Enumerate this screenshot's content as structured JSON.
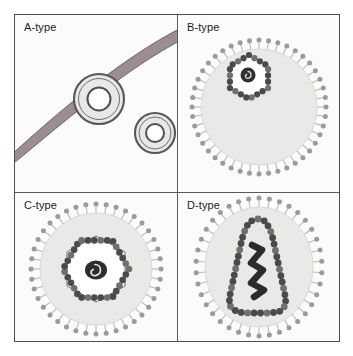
{
  "figure": {
    "canvas_width": 353,
    "canvas_height": 356,
    "background_color": "#ffffff",
    "panel_background_color": "#fbfbfb",
    "frame_color": "#4e4e52",
    "divider_color": "#5a5a5e",
    "layout": "2x2 grid of labelled panels"
  },
  "palette": {
    "membrane_band": "#9b8d93",
    "membrane_band_edge": "#6e6468",
    "particle_fill": "#e8e8e6",
    "particle_outline": "#5c5c5e",
    "envelope_fill": "#e9e9e7",
    "envelope_edge": "#d2d2cf",
    "spike_line": "#b9b9bd",
    "spike_knob": "#9a9a9f",
    "capsid_bead": "#4a4a4c",
    "capsid_bead_light": "#6f6f72",
    "capsid_interior": "#ffffff",
    "core_dark": "#2b2b2d",
    "label_text": "#1d1d1f"
  },
  "panels": [
    {
      "id": "a-type",
      "label": "A-type",
      "position": "top-left",
      "description": "Intracellular A-type particles: doughnut-shaped concentric rings, one budding at a membrane band, one free in cytoplasm",
      "features": {
        "membrane_band": true,
        "envelope_spikes": false,
        "capsid_shape": "ring",
        "particle_count": 2
      },
      "particles": [
        {
          "name": "membrane-associated-ring",
          "cx": 84,
          "cy": 84,
          "outer_r": 25,
          "inner_r": 11
        },
        {
          "name": "free-ring",
          "cx": 140,
          "cy": 118,
          "outer_r": 20,
          "inner_r": 9
        }
      ]
    },
    {
      "id": "b-type",
      "label": "B-type",
      "position": "top-right",
      "description": "B-type particle: spiked envelope with a small eccentric beaded hexagonal capsid containing a condensed nucleoid",
      "features": {
        "membrane_band": false,
        "envelope_spikes": true,
        "capsid_shape": "hexagon-eccentric",
        "capsid_size": "small",
        "core": "condensed spiral nucleoid",
        "spike_count": 44
      },
      "geometry": {
        "cx": 81,
        "cy": 92,
        "envelope_r": 58,
        "capsid_r": 22,
        "capsid_cx": 71,
        "capsid_cy": 62
      }
    },
    {
      "id": "c-type",
      "label": "C-type",
      "position": "bottom-left",
      "description": "C-type particle: spiked envelope with a large centred beaded hexagonal capsid and a spiral nucleoid core",
      "features": {
        "membrane_band": false,
        "envelope_spikes": true,
        "capsid_shape": "hexagon-centred",
        "capsid_size": "large",
        "core": "spiral nucleoid",
        "spike_count": 40
      },
      "geometry": {
        "cx": 81,
        "cy": 76,
        "envelope_r": 56,
        "capsid_r": 33,
        "capsid_cx": 81,
        "capsid_cy": 76
      }
    },
    {
      "id": "d-type",
      "label": "D-type",
      "position": "bottom-right",
      "description": "D-type particle: spiked envelope enclosing a cone-shaped (trapezoidal) beaded capsid with an elongated zig-zag nucleoid",
      "features": {
        "membrane_band": false,
        "envelope_spikes": true,
        "capsid_shape": "cone-trapezoid",
        "capsid_size": "large",
        "core": "elongated zig-zag nucleoid",
        "spike_count": 38
      },
      "geometry": {
        "cx": 81,
        "cy": 74,
        "envelope_rx": 54,
        "envelope_ry": 60
      }
    }
  ]
}
